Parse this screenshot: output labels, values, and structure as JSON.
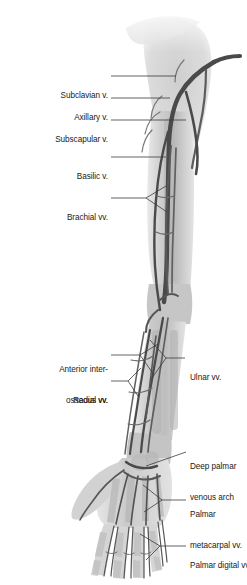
{
  "figure": {
    "view": "right upper limb, anterior (palmar) view",
    "colors": {
      "vein": "#4a4a4a",
      "vein_light": "#6f6f6f",
      "background_tissue": "#c9c9c9",
      "bone": "#b4b4b4",
      "leader": "#3a3a3a",
      "text": "#1a1a1a",
      "page": "#ffffff"
    }
  },
  "labels_left": [
    {
      "id": "subclavian",
      "lines": [
        "Subclavian v."
      ]
    },
    {
      "id": "axillary",
      "lines": [
        "Axillary v."
      ]
    },
    {
      "id": "subscapular",
      "lines": [
        "Subscapular v."
      ]
    },
    {
      "id": "basilic",
      "lines": [
        "Basilic v."
      ]
    },
    {
      "id": "brachial",
      "lines": [
        "Brachial vv."
      ]
    },
    {
      "id": "anterior-interosseous",
      "lines": [
        "Anterior inter-",
        "osseous vv."
      ]
    },
    {
      "id": "radial",
      "lines": [
        "Radial vv."
      ]
    }
  ],
  "labels_right": [
    {
      "id": "ulnar",
      "lines": [
        "Ulnar vv."
      ]
    },
    {
      "id": "deep-palmar-arch",
      "lines": [
        "Deep palmar",
        "venous arch"
      ]
    },
    {
      "id": "palmar-metacarpal",
      "lines": [
        "Palmar",
        "metacarpal vv."
      ]
    },
    {
      "id": "palmar-digital",
      "lines": [
        "Palmar digital vv."
      ]
    }
  ]
}
